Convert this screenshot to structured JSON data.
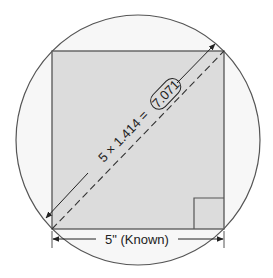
{
  "diagram": {
    "diagonal_label": {
      "expression": "5 × 1.414 =",
      "result": "7.071"
    },
    "side_label": "5\" (Known)",
    "colors": {
      "square_fill": "#dcdcdc",
      "circle_fill": "#f7f7f7",
      "stroke": "#555555",
      "text": "#222222"
    },
    "elements": [
      {
        "type": "circle",
        "label": "circumscribed circle"
      },
      {
        "type": "square",
        "label": "square, side 5\""
      },
      {
        "type": "right-angle-marker",
        "corner": "bottom-right"
      },
      {
        "type": "diagonal",
        "style": "dashed"
      },
      {
        "type": "dimension-line",
        "target": "diagonal",
        "value": "7.071"
      },
      {
        "type": "dimension-line",
        "target": "bottom side",
        "value": "5\""
      }
    ]
  }
}
